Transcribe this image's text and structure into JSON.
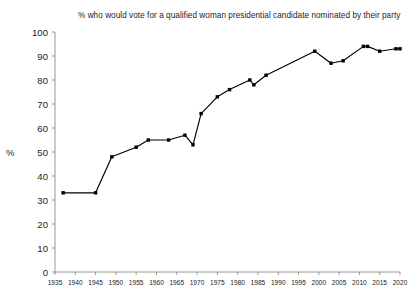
{
  "chart_data": {
    "type": "line",
    "title": "% who would vote for a qualified woman presidential candidate nominated by their party",
    "xlabel": "",
    "ylabel": "%",
    "xlim": [
      1935,
      2020
    ],
    "ylim": [
      0,
      100
    ],
    "grid": false,
    "legend": "none",
    "marker": "square",
    "line_color": "#000000",
    "marker_color": "#000000",
    "xticks": [
      1935,
      1940,
      1945,
      1950,
      1955,
      1960,
      1965,
      1970,
      1975,
      1980,
      1985,
      1990,
      1995,
      2000,
      2005,
      2010,
      2015,
      2020
    ],
    "yticks": [
      0,
      10,
      20,
      30,
      40,
      50,
      60,
      70,
      80,
      90,
      100
    ],
    "series": [
      {
        "name": "% who would vote for a qualified woman presidential candidate",
        "x": [
          1937,
          1945,
          1949,
          1955,
          1958,
          1963,
          1967,
          1969,
          1971,
          1975,
          1978,
          1983,
          1984,
          1987,
          1999,
          2003,
          2006,
          2011,
          2012,
          2015,
          2019,
          2020
        ],
        "y": [
          33,
          33,
          48,
          52,
          55,
          55,
          57,
          53,
          66,
          73,
          76,
          80,
          78,
          82,
          92,
          87,
          88,
          94,
          94,
          92,
          93,
          93
        ]
      }
    ]
  }
}
